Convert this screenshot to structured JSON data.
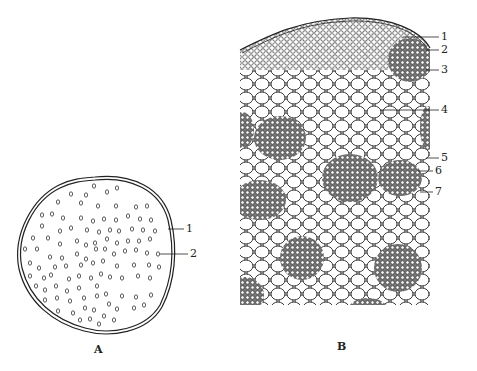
{
  "figure": {
    "panel_a": {
      "caption": "A",
      "description": "Transverse section outline of stem with scattered vascular bundles",
      "labels": [
        {
          "num": "1",
          "target": "outer layer"
        },
        {
          "num": "2",
          "target": "vascular bundle"
        }
      ]
    },
    "panel_b": {
      "caption": "B",
      "description": "Detailed cellular view of stem section with epidermis, ground tissue and scattered vascular bundles",
      "labels": [
        {
          "num": "1"
        },
        {
          "num": "2"
        },
        {
          "num": "3"
        },
        {
          "num": "4"
        },
        {
          "num": "5"
        },
        {
          "num": "6"
        },
        {
          "num": "7"
        }
      ]
    },
    "colors": {
      "ink": "#222222",
      "background": "#ffffff",
      "stipple": "#888888"
    }
  }
}
